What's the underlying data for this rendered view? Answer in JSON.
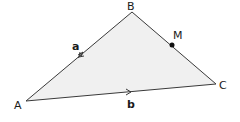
{
  "diagram": {
    "type": "triangle",
    "fill_color": "#f0f0f0",
    "stroke_color": "#3a3a3a",
    "vertices": {
      "A": {
        "label": "A",
        "x": 26,
        "y": 101
      },
      "B": {
        "label": "B",
        "x": 132,
        "y": 12
      },
      "C": {
        "label": "C",
        "x": 216,
        "y": 84
      }
    },
    "point_M": {
      "label": "M",
      "x": 172,
      "y": 45,
      "on_segment": "BC"
    },
    "vectors": [
      {
        "label": "a",
        "segment": "AB",
        "direction": "B to A"
      },
      {
        "label": "b",
        "segment": "AC",
        "direction": "A to C"
      }
    ]
  }
}
